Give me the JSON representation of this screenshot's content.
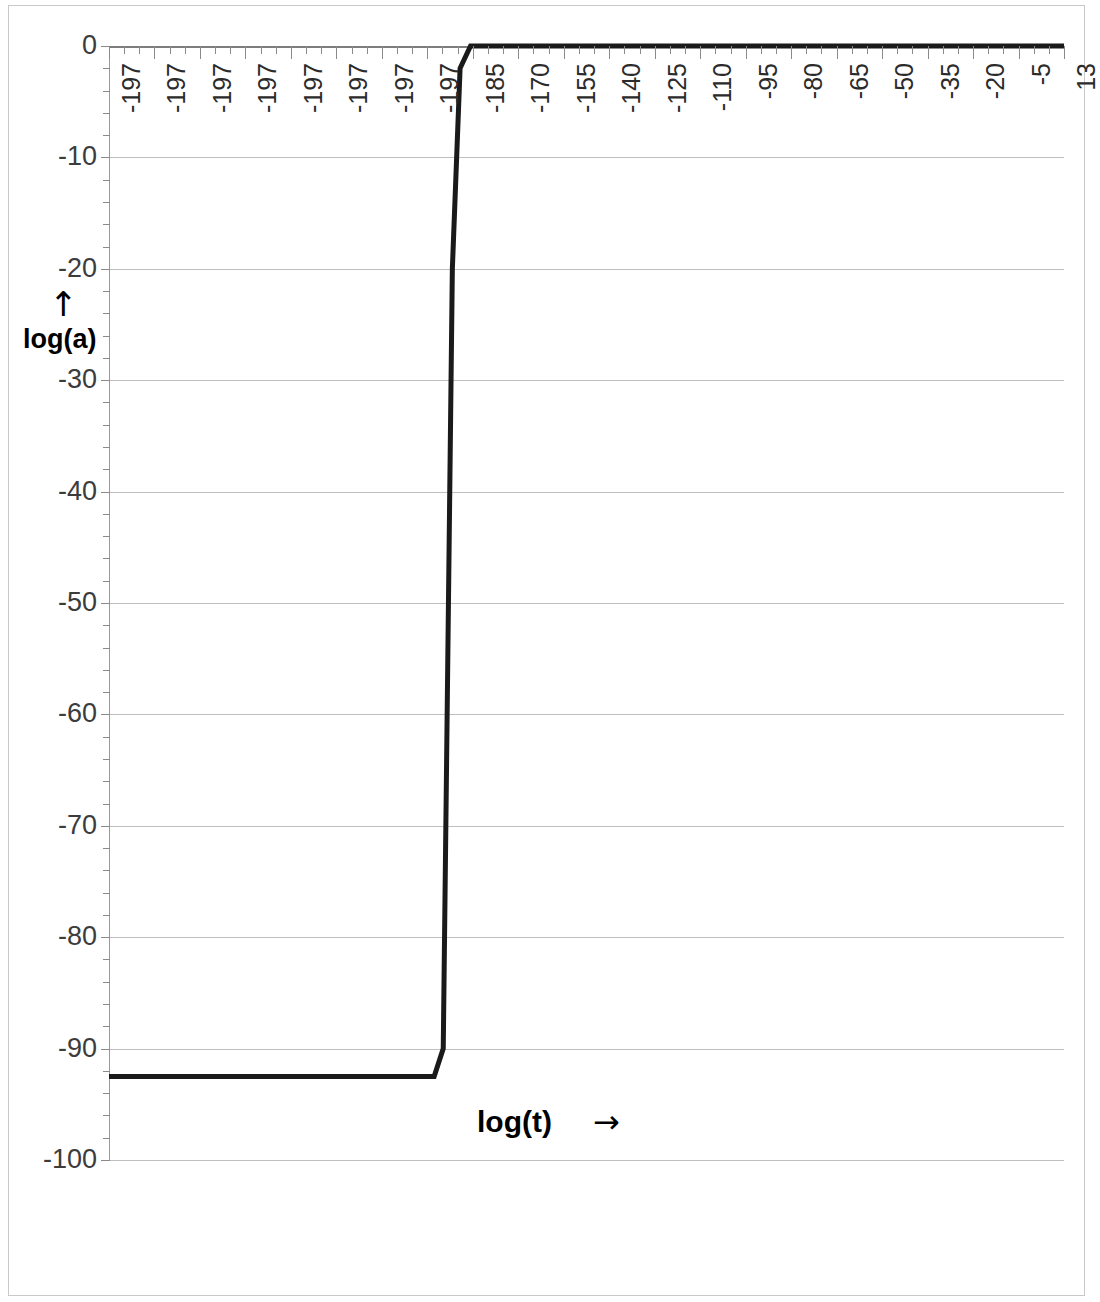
{
  "chart_data": {
    "type": "line",
    "title": "",
    "xlabel": "log(t)",
    "ylabel": "log(a)",
    "xlabel_arrow": "→",
    "ylabel_arrow": "↑",
    "grid": true,
    "legend": "none",
    "ylim": [
      -100,
      0
    ],
    "yticks": [
      0,
      -10,
      -20,
      -30,
      -40,
      -50,
      -60,
      -70,
      -80,
      -90,
      -100
    ],
    "ytick_labels": [
      "0",
      "-10",
      "-20",
      "-30",
      "-40",
      "-50",
      "-60",
      "-70",
      "-80",
      "-90",
      "-100"
    ],
    "xtick_labels": [
      "-197",
      "-197",
      "-197",
      "-197",
      "-197",
      "-197",
      "-197",
      "-197",
      "-185",
      "-170",
      "-155",
      "-140",
      "-125",
      "-110",
      "-95",
      "-80",
      "-65",
      "-50",
      "-35",
      "-20",
      "-5",
      "13"
    ],
    "x_index_range": [
      0,
      21
    ],
    "series": [
      {
        "name": "log(a)",
        "color": "#1a1a1a",
        "line_width": 5,
        "points": [
          {
            "x_index": 0.0,
            "y": -92.5
          },
          {
            "x_index": 7.15,
            "y": -92.5
          },
          {
            "x_index": 7.35,
            "y": -90.0
          },
          {
            "x_index": 7.55,
            "y": -20.0
          },
          {
            "x_index": 7.72,
            "y": -2.0
          },
          {
            "x_index": 7.95,
            "y": 0.0
          },
          {
            "x_index": 21.0,
            "y": 0.0
          }
        ]
      }
    ]
  }
}
